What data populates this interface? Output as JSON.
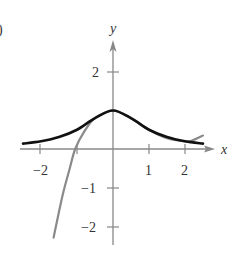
{
  "figure": {
    "panel_label": ")"
  },
  "chart_data": {
    "type": "line",
    "title": "",
    "xlabel": "x",
    "ylabel": "y",
    "xlim": [
      -2.5,
      2.7
    ],
    "ylim": [
      -2.4,
      2.8
    ],
    "grid": false,
    "legend": null,
    "x_ticks": [
      -2,
      -1,
      1,
      2
    ],
    "x_tick_labels": [
      "−2",
      "",
      "1",
      "2"
    ],
    "y_ticks": [
      2,
      -1,
      -2
    ],
    "y_tick_labels": [
      "2",
      "−1",
      "−2"
    ],
    "series": [
      {
        "name": "f(x) (black bell curve)",
        "color": "#111111",
        "x": [
          -2.5,
          -2,
          -1.5,
          -1,
          -0.5,
          0,
          0.5,
          1,
          1.5,
          2,
          2.5
        ],
        "values": [
          0.14,
          0.2,
          0.31,
          0.5,
          0.8,
          1.0,
          0.8,
          0.5,
          0.31,
          0.2,
          0.14
        ]
      },
      {
        "name": "approximating polynomial (gray)",
        "color": "#8a8a8a",
        "x": [
          -1.65,
          -1.4,
          -1.2,
          -1.05,
          -0.8,
          -0.5,
          0,
          0.5,
          1,
          1.5,
          2,
          2.2,
          2.5
        ],
        "values": [
          -2.3,
          -1.2,
          -0.5,
          0.0,
          0.45,
          0.8,
          1.0,
          0.8,
          0.5,
          0.28,
          0.2,
          0.22,
          0.35
        ]
      }
    ]
  }
}
